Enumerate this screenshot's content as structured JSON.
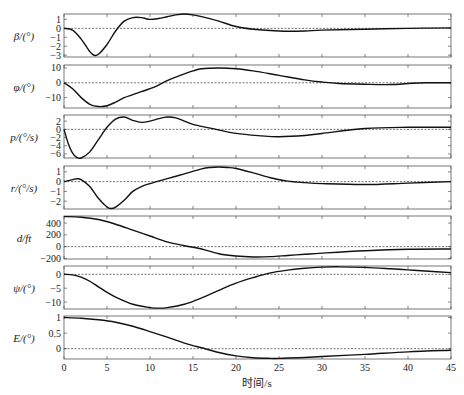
{
  "figure": {
    "xlabel": "时间/s",
    "x_ticks": [
      0,
      5,
      10,
      15,
      20,
      25,
      30,
      35,
      40,
      45
    ],
    "colors": {
      "line": "#111111",
      "axis": "#555555",
      "zero_line": "#333333",
      "background": "#ffffff"
    }
  },
  "chart_data": [
    {
      "type": "line",
      "ylabel": "β/(°)",
      "xlim": [
        0,
        45
      ],
      "ylim": [
        -3.2,
        1.6
      ],
      "y_ticks": [
        1,
        0,
        -1,
        -2,
        -3
      ],
      "zero_line": true,
      "x": [
        0,
        1,
        2,
        3,
        3.5,
        4,
        5,
        6,
        7,
        8,
        9,
        10,
        11,
        12,
        13,
        14,
        15,
        16,
        18,
        20,
        22,
        25,
        28,
        30,
        35,
        40,
        45
      ],
      "values": [
        0,
        -0.2,
        -1.2,
        -2.6,
        -3.0,
        -2.9,
        -1.8,
        -0.3,
        0.8,
        1.2,
        1.2,
        1.0,
        1.1,
        1.3,
        1.5,
        1.6,
        1.5,
        1.3,
        0.8,
        0.2,
        -0.1,
        -0.3,
        -0.3,
        -0.2,
        -0.1,
        0.0,
        0.05
      ]
    },
    {
      "type": "line",
      "ylabel": "φ/(°)",
      "xlim": [
        0,
        45
      ],
      "ylim": [
        -17,
        12
      ],
      "y_ticks": [
        10,
        0,
        -10
      ],
      "zero_line": true,
      "x": [
        0,
        1,
        2,
        3,
        4,
        5,
        6,
        7,
        8,
        9,
        10,
        11,
        12,
        14,
        15,
        16,
        18,
        20,
        22,
        25,
        28,
        30,
        32,
        35,
        38,
        40,
        42,
        45
      ],
      "values": [
        0,
        -4,
        -10,
        -14.5,
        -16,
        -15.5,
        -13,
        -10,
        -8,
        -6,
        -4,
        -1.5,
        1.5,
        6,
        8,
        9.5,
        10,
        9.5,
        8,
        5,
        2,
        0.5,
        -0.5,
        -1,
        -1.2,
        -0.5,
        0,
        0
      ]
    },
    {
      "type": "line",
      "ylabel": "p/(°/s)",
      "xlim": [
        0,
        45
      ],
      "ylim": [
        -7,
        3.5
      ],
      "y_ticks": [
        2,
        0,
        -2,
        -4,
        -6
      ],
      "zero_line": true,
      "x": [
        0,
        0.5,
        1,
        1.5,
        2,
        3,
        4,
        5,
        6,
        7,
        8,
        9,
        10,
        11,
        12,
        13,
        14,
        15,
        17,
        20,
        23,
        25,
        28,
        30,
        35,
        40,
        45
      ],
      "values": [
        0,
        -3.5,
        -5.8,
        -6.9,
        -7.0,
        -5.5,
        -2.5,
        0.5,
        2.5,
        3.0,
        2.2,
        1.7,
        2.0,
        2.6,
        3.0,
        2.8,
        2.0,
        1.2,
        0.3,
        -1.0,
        -1.6,
        -1.8,
        -1.5,
        -1.0,
        0.2,
        0.5,
        0.5
      ]
    },
    {
      "type": "line",
      "ylabel": "r/(°/s)",
      "xlim": [
        0,
        45
      ],
      "ylim": [
        -2.8,
        1.6
      ],
      "y_ticks": [
        1,
        0,
        -1,
        -2
      ],
      "zero_line": true,
      "x": [
        0,
        1,
        1.5,
        2,
        3,
        4,
        5,
        5.5,
        6,
        7,
        8,
        9,
        10,
        12,
        14,
        16,
        17,
        18,
        19,
        20,
        22,
        24,
        26,
        28,
        30,
        35,
        40,
        45
      ],
      "values": [
        0,
        0.2,
        0.3,
        0.2,
        -0.5,
        -1.7,
        -2.6,
        -2.75,
        -2.6,
        -1.9,
        -1.0,
        -0.5,
        -0.2,
        0.3,
        0.8,
        1.3,
        1.45,
        1.5,
        1.45,
        1.35,
        0.9,
        0.4,
        0.05,
        -0.1,
        -0.2,
        -0.3,
        -0.15,
        0.0
      ]
    },
    {
      "type": "line",
      "ylabel": "d/ft",
      "xlim": [
        0,
        45
      ],
      "ylim": [
        -210,
        520
      ],
      "y_ticks": [
        400,
        200,
        0,
        -200
      ],
      "zero_line": true,
      "x": [
        0,
        2,
        4,
        6,
        8,
        10,
        12,
        14,
        15,
        16,
        18,
        20,
        22,
        24,
        26,
        28,
        30,
        35,
        40,
        45
      ],
      "values": [
        510,
        500,
        460,
        380,
        280,
        180,
        80,
        15,
        -10,
        -40,
        -120,
        -160,
        -175,
        -170,
        -150,
        -130,
        -110,
        -70,
        -45,
        -40
      ]
    },
    {
      "type": "line",
      "ylabel": "ψ/(°)",
      "xlim": [
        0,
        45
      ],
      "ylim": [
        -12.5,
        3
      ],
      "y_ticks": [
        0,
        -5,
        -10
      ],
      "zero_line": true,
      "x": [
        0,
        1,
        2,
        3,
        4,
        5,
        6,
        8,
        10,
        11,
        12,
        14,
        16,
        18,
        20,
        22,
        24,
        26,
        28,
        30,
        32,
        35,
        38,
        40,
        42,
        45
      ],
      "values": [
        0,
        -0.2,
        -1.0,
        -2.5,
        -4.5,
        -6.5,
        -8.2,
        -10.8,
        -12.0,
        -12.2,
        -12.0,
        -10.8,
        -8.5,
        -5.8,
        -3.2,
        -1.2,
        0.5,
        1.5,
        2.2,
        2.6,
        2.7,
        2.5,
        2.0,
        1.6,
        1.2,
        0.6
      ]
    },
    {
      "type": "line",
      "ylabel": "E/(°)",
      "xlim": [
        0,
        45
      ],
      "ylim": [
        -0.33,
        1.05
      ],
      "y_ticks": [
        1,
        0.5,
        0
      ],
      "zero_line": true,
      "x": [
        0,
        2,
        4,
        6,
        8,
        10,
        12,
        14,
        15,
        16,
        18,
        20,
        22,
        24,
        25,
        26,
        28,
        30,
        35,
        40,
        45
      ],
      "values": [
        1.0,
        0.98,
        0.93,
        0.85,
        0.72,
        0.55,
        0.37,
        0.18,
        0.1,
        0.03,
        -0.12,
        -0.23,
        -0.29,
        -0.31,
        -0.31,
        -0.3,
        -0.28,
        -0.25,
        -0.18,
        -0.1,
        -0.05
      ]
    }
  ],
  "panels_layout": [
    {
      "top": 14,
      "bottom": 57
    },
    {
      "top": 65,
      "bottom": 108
    },
    {
      "top": 115,
      "bottom": 158
    },
    {
      "top": 166,
      "bottom": 209
    },
    {
      "top": 216,
      "bottom": 259
    },
    {
      "top": 266,
      "bottom": 309
    },
    {
      "top": 316,
      "bottom": 359
    }
  ]
}
